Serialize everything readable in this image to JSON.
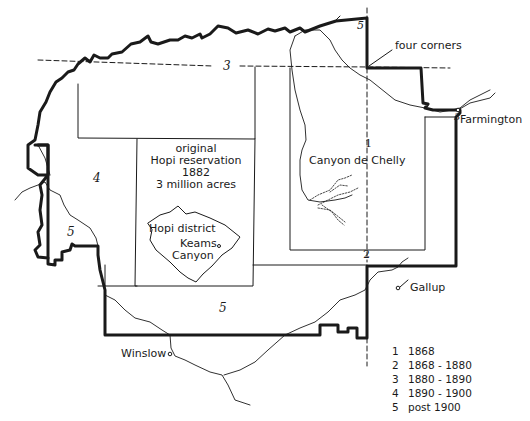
{
  "map": {
    "title": "Navajo reservation expansion",
    "places": {
      "four_corners": "four corners",
      "farmington": "Farmington",
      "gallup": "Gallup",
      "winslow": "Winslow",
      "canyon_de_chelly": "Canyon de Chelly",
      "hopi_district": "Hopi district",
      "keams_canyon_1": "Keams",
      "keams_canyon_2": "Canyon"
    },
    "hopi_reservation": {
      "line1": "original",
      "line2": "Hopi reservation",
      "line3": "1882",
      "line4": "3 million acres"
    },
    "region_labels": {
      "r1": "1",
      "r2": "2",
      "r3_top": "3",
      "r3_east": "3",
      "r4": "4",
      "r5_west": "5",
      "r5_south": "5",
      "r5_north": "5"
    },
    "colors": {
      "ink": "#1a1a1a",
      "background": "#ffffff"
    }
  },
  "legend": {
    "items": [
      {
        "key": "1",
        "label": "1868"
      },
      {
        "key": "2",
        "label": "1868 - 1880"
      },
      {
        "key": "3",
        "label": "1880 - 1890"
      },
      {
        "key": "4",
        "label": "1890 - 1900"
      },
      {
        "key": "5",
        "label": "post 1900"
      }
    ]
  }
}
